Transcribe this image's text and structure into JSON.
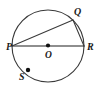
{
  "diagram": {
    "kind": "circle-geometry",
    "background_color": "#ffffff",
    "stroke_color": "#3a3a3a",
    "label_color": "#1a1a1a",
    "width": 96,
    "height": 89,
    "circle": {
      "center_x": 48,
      "center_y": 46,
      "radius": 36
    },
    "labels": {
      "p": "P",
      "q": "Q",
      "r": "R",
      "s": "S",
      "o": "O"
    },
    "points": [
      {
        "id": "P",
        "label": "P",
        "x": 12,
        "y": 46,
        "on_circle": true,
        "dot": false,
        "label_x": 6,
        "label_y": 50
      },
      {
        "id": "Q",
        "label": "Q",
        "x": 73,
        "y": 20,
        "on_circle": true,
        "dot": false,
        "label_x": 74,
        "label_y": 15
      },
      {
        "id": "R",
        "label": "R",
        "x": 84,
        "y": 46,
        "on_circle": true,
        "dot": false,
        "label_x": 87,
        "label_y": 50
      },
      {
        "id": "S",
        "label": "S",
        "x": 28,
        "y": 70,
        "on_circle": true,
        "dot": true,
        "label_x": 19,
        "label_y": 80
      },
      {
        "id": "O",
        "label": "O",
        "x": 48,
        "y": 46,
        "on_circle": false,
        "dot": true,
        "label_x": 45,
        "label_y": 58
      }
    ],
    "segments": [
      {
        "id": "PR",
        "from": "P",
        "to": "R",
        "type": "diameter",
        "x1": 12,
        "y1": 46,
        "x2": 84,
        "y2": 46
      },
      {
        "id": "PQ",
        "from": "P",
        "to": "Q",
        "type": "chord",
        "x1": 12,
        "y1": 46,
        "x2": 73,
        "y2": 20
      },
      {
        "id": "QR",
        "from": "Q",
        "to": "R",
        "type": "chord",
        "x1": 73,
        "y1": 20,
        "x2": 84,
        "y2": 46
      }
    ]
  }
}
